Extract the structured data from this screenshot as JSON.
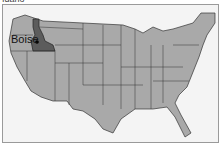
{
  "caption": "Idaho",
  "map": {
    "highlighted_state": "Idaho",
    "city_label": "Boise",
    "colors": {
      "land": "#a9a9a9",
      "highlight": "#5c5c5c",
      "border": "#333333",
      "water": "#f4f4f4",
      "foreign": "#ffffff"
    }
  }
}
